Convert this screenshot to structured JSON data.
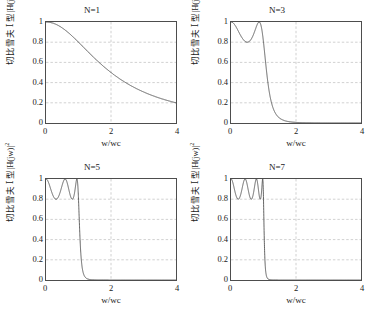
{
  "figure": {
    "layout": "2x2",
    "width": 369,
    "height": 313,
    "background": "#ffffff",
    "axis_color": "#4d4d4d",
    "grid_color": "#b0b0b0",
    "curve_color": "#3a3a3a"
  },
  "common": {
    "xlabel": "w/wc",
    "ylabel_prefix": "切比雪夫 Ⅰ 型|H(jw)|",
    "ylabel_sup": "2",
    "xticks": [
      "0",
      "2",
      "4"
    ],
    "yticks": [
      "1",
      "0.8",
      "0.6",
      "0.4",
      "0.2",
      "0"
    ],
    "xlim": [
      0,
      4
    ],
    "ylim": [
      0,
      1
    ]
  },
  "chart_data": [
    {
      "type": "line",
      "title": "N=1",
      "xlabel": "w/wc",
      "ylabel": "切比雪夫 Ⅰ 型|H(jw)|²",
      "xlim": [
        0,
        4
      ],
      "ylim": [
        0,
        1
      ],
      "xticks": [
        0,
        2,
        4
      ],
      "yticks": [
        0,
        0.2,
        0.4,
        0.6,
        0.8,
        1
      ],
      "grid": true,
      "legend": null,
      "order_N": 1,
      "ripple_min": 0.8,
      "epsilon_squared": 0.25,
      "series": [
        {
          "name": "|H(jw)|^2, N=1",
          "x": [
            0,
            0.2,
            0.4,
            0.6,
            0.8,
            1.0,
            1.2,
            1.4,
            1.6,
            1.8,
            2.0,
            2.4,
            2.8,
            3.2,
            3.6,
            4.0
          ],
          "values": [
            1.0,
            0.99,
            0.961,
            0.917,
            0.862,
            0.8,
            0.735,
            0.671,
            0.61,
            0.552,
            0.5,
            0.41,
            0.338,
            0.281,
            0.236,
            0.2
          ]
        }
      ]
    },
    {
      "type": "line",
      "title": "N=3",
      "xlabel": "w/wc",
      "ylabel": "切比雪夫 Ⅰ 型|H(jw)|²",
      "xlim": [
        0,
        4
      ],
      "ylim": [
        0,
        1
      ],
      "xticks": [
        0,
        2,
        4
      ],
      "yticks": [
        0,
        0.2,
        0.4,
        0.6,
        0.8,
        1
      ],
      "grid": true,
      "legend": null,
      "order_N": 3,
      "ripple_min": 0.8,
      "epsilon_squared": 0.25,
      "ripple_count": 1,
      "series": [
        {
          "name": "|H(jw)|^2, N=3",
          "x": [
            0,
            0.2,
            0.4,
            0.5,
            0.6,
            0.8,
            0.87,
            1.0,
            1.2,
            1.4,
            1.6,
            1.8,
            2.0,
            3.0,
            4.0
          ],
          "values": [
            1.0,
            0.896,
            0.804,
            0.8,
            0.818,
            0.963,
            1.0,
            0.8,
            0.318,
            0.123,
            0.056,
            0.029,
            0.017,
            0.0015,
            0.0004
          ]
        }
      ]
    },
    {
      "type": "line",
      "title": "N=5",
      "xlabel": "w/wc",
      "ylabel": "切比雪夫 Ⅰ 型|H(jw)|²",
      "xlim": [
        0,
        4
      ],
      "ylim": [
        0,
        1
      ],
      "xticks": [
        0,
        2,
        4
      ],
      "yticks": [
        0,
        0.2,
        0.4,
        0.6,
        0.8,
        1
      ],
      "grid": true,
      "legend": null,
      "order_N": 5,
      "ripple_min": 0.8,
      "epsilon_squared": 0.25,
      "ripple_count": 2,
      "series": [
        {
          "name": "|H(jw)|^2, N=5",
          "x": [
            0,
            0.16,
            0.31,
            0.45,
            0.59,
            0.71,
            0.81,
            0.95,
            1.0,
            1.1,
            1.2,
            1.3,
            1.5,
            2.0,
            3.0,
            4.0
          ],
          "values": [
            1.0,
            0.868,
            0.8,
            0.953,
            1.0,
            0.845,
            0.8,
            1.0,
            0.8,
            0.23,
            0.073,
            0.029,
            0.007,
            0.0006,
            2e-05,
            2e-06
          ]
        }
      ]
    },
    {
      "type": "line",
      "title": "N=7",
      "xlabel": "w/wc",
      "ylabel": "切比雪夫 Ⅰ 型|H(jw)|²",
      "xlim": [
        0,
        4
      ],
      "ylim": [
        0,
        1
      ],
      "xticks": [
        0,
        2,
        4
      ],
      "yticks": [
        0,
        0.2,
        0.4,
        0.6,
        0.8,
        1
      ],
      "grid": true,
      "legend": null,
      "order_N": 7,
      "ripple_min": 0.8,
      "epsilon_squared": 0.25,
      "ripple_count": 3,
      "series": [
        {
          "name": "|H(jw)|^2, N=7",
          "x": [
            0,
            0.11,
            0.22,
            0.32,
            0.43,
            0.52,
            0.62,
            0.71,
            0.78,
            0.9,
            0.97,
            1.0,
            1.08,
            1.15,
            1.3,
            2.0,
            4.0
          ],
          "values": [
            1.0,
            0.82,
            0.8,
            0.99,
            1.0,
            0.81,
            0.8,
            0.98,
            1.0,
            0.82,
            1.0,
            0.8,
            0.21,
            0.05,
            0.008,
            5e-05,
            1e-07
          ]
        }
      ]
    }
  ],
  "subplots": [
    {
      "id": "n1",
      "title": "N=1",
      "order": 1,
      "pos": {
        "left": 0,
        "top": 0
      }
    },
    {
      "id": "n3",
      "title": "N=3",
      "order": 3,
      "pos": {
        "left": 185,
        "top": 0
      }
    },
    {
      "id": "n5",
      "title": "N=5",
      "order": 5,
      "pos": {
        "left": 0,
        "top": 157
      }
    },
    {
      "id": "n7",
      "title": "N=7",
      "order": 7,
      "pos": {
        "left": 185,
        "top": 157
      }
    }
  ]
}
